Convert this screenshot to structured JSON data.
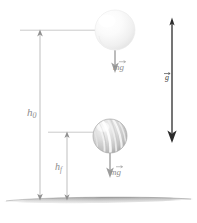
{
  "figure": {
    "background_color": "#ffffff",
    "width": 197,
    "height": 223
  },
  "labels": {
    "height_initial": "h",
    "height_initial_sub": "0",
    "height_final": "h",
    "height_final_sub": "f",
    "weight_top_m": "m",
    "weight_top_g": "g",
    "weight_bottom_m": "m",
    "weight_bottom_g": "g",
    "gravity_vector": "g"
  },
  "objects": {
    "ball_top": {
      "name": "falling-ball-initial",
      "cx": 115,
      "cy": 30,
      "r": 20,
      "fill_light": "#ffffff",
      "fill_dark": "#e8e8e8"
    },
    "ball_bottom": {
      "name": "falling-ball-final",
      "cx": 110,
      "cy": 136,
      "r": 17,
      "fill_light": "#f2f2f2",
      "fill_dark": "#b8b8b8"
    }
  },
  "vectors": {
    "weight_top": {
      "x": 115,
      "y_start": 30,
      "y_end": 72,
      "color": "#9a9a9a"
    },
    "weight_bottom": {
      "x": 110,
      "y_start": 136,
      "y_end": 177,
      "color": "#9a9a9a"
    },
    "gravity": {
      "x": 172,
      "y_start": 18,
      "y_end": 142,
      "color": "#2b2b2b"
    }
  },
  "dimensions": {
    "h0": {
      "x": 40,
      "y_top": 30,
      "y_bottom": 200,
      "color": "#b5b5b5"
    },
    "hf": {
      "x": 67,
      "y_top": 132,
      "y_bottom": 200,
      "color": "#b5b5b5"
    }
  },
  "reference_lines": {
    "top": {
      "x1": 20,
      "x2": 95,
      "y": 30,
      "color": "#c0c0c0"
    },
    "middle": {
      "x1": 48,
      "x2": 110,
      "y": 132,
      "color": "#c0c0c0"
    }
  },
  "ground": {
    "name": "ground-surface",
    "y": 200,
    "x_left": 4,
    "x_right": 193,
    "color_top": "#8e8e8e",
    "color_bottom": "#d8d8d8"
  },
  "colors": {
    "line_gray": "#b5b5b5",
    "text_gray": "#8c8c8c",
    "arrow_dark": "#2b2b2b",
    "background": "#ffffff"
  }
}
